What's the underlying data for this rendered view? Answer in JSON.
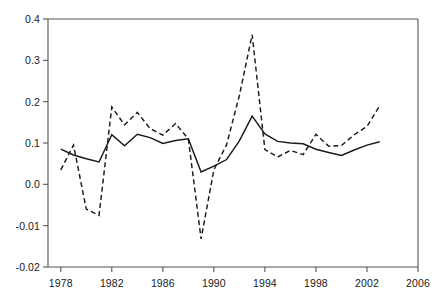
{
  "chart_data": {
    "type": "line",
    "title": "",
    "xlabel": "",
    "ylabel": "",
    "xlim": [
      1977.0,
      2006.0
    ],
    "ylim_labels": [
      "-0.02",
      "-0.01",
      "0.0",
      "0.1",
      "0.2",
      "0.3",
      "0.4"
    ],
    "xticks": [
      1978,
      1982,
      1986,
      1990,
      1994,
      1998,
      2002,
      2006
    ],
    "xticklabels": [
      "1978",
      "1982",
      "1986",
      "1990",
      "1994",
      "1998",
      "2002",
      "2006"
    ],
    "yticks": [
      -0.02,
      -0.01,
      0.0,
      0.1,
      0.2,
      0.3,
      0.4
    ],
    "yticklabels": [
      "-0.02",
      "-0.01",
      "0.0",
      "0.1",
      "0.2",
      "0.3",
      "0.4"
    ],
    "grid": false,
    "legend": "none",
    "axis_spines": [
      "left",
      "bottom"
    ],
    "series": [
      {
        "name": "solid-series",
        "style": "solid",
        "color": "#1a1a1a",
        "x": [
          1978,
          1979,
          1980,
          1981,
          1982,
          1983,
          1984,
          1985,
          1986,
          1987,
          1988,
          1989,
          1990,
          1991,
          1992,
          1993,
          1994,
          1995,
          1996,
          1997,
          1998,
          1999,
          2000,
          2001,
          2002,
          2003
        ],
        "values": [
          0.085,
          0.071,
          0.062,
          0.054,
          0.12,
          0.093,
          0.121,
          0.113,
          0.099,
          0.106,
          0.11,
          0.03,
          0.044,
          0.06,
          0.105,
          0.165,
          0.122,
          0.104,
          0.1,
          0.098,
          0.085,
          0.077,
          0.07,
          0.083,
          0.095,
          0.103
        ]
      },
      {
        "name": "dashed-series",
        "style": "dashed",
        "color": "#1a1a1a",
        "x": [
          1978,
          1979,
          1980,
          1981,
          1982,
          1983,
          1984,
          1985,
          1986,
          1987,
          1988,
          1989,
          1990,
          1991,
          1992,
          1993,
          1994,
          1995,
          1996,
          1997,
          1998,
          1999,
          2000,
          2001,
          2002,
          2003
        ],
        "values": [
          0.035,
          0.095,
          -0.006,
          -0.0075,
          0.187,
          0.144,
          0.174,
          0.135,
          0.119,
          0.147,
          0.11,
          -0.0132,
          0.035,
          0.096,
          0.215,
          0.362,
          0.084,
          0.066,
          0.082,
          0.072,
          0.121,
          0.092,
          0.094,
          0.12,
          0.14,
          0.19
        ]
      }
    ],
    "annotations": []
  }
}
